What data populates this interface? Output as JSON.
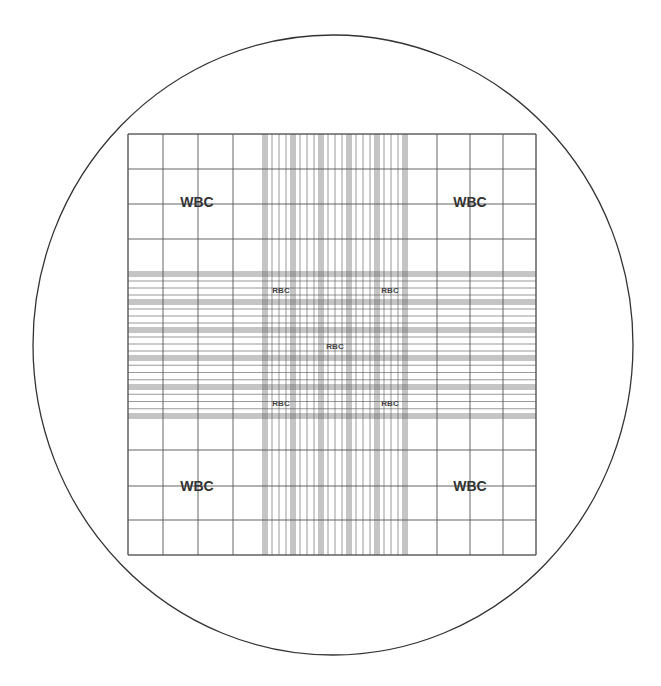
{
  "diagram": {
    "colors": {
      "background": "#ffffff",
      "circle": "#333333",
      "grid_line": "#555555",
      "label_dark": "#333333"
    },
    "circle": {
      "cx": 333,
      "cy": 345,
      "rx": 300,
      "ry": 310
    },
    "grid": {
      "x_start": 128,
      "x_end": 536,
      "y_start": 134,
      "y_end": 555,
      "outer_x_lines": [
        128,
        163,
        198,
        233,
        265,
        405,
        437,
        470,
        503,
        536
      ],
      "outer_y_lines": [
        134,
        169,
        204,
        239,
        274,
        416,
        450,
        486,
        520,
        555
      ],
      "center_x_groups": [
        265,
        293,
        321,
        349,
        377,
        405
      ],
      "center_y_groups": [
        274,
        302,
        330,
        358,
        387,
        416
      ],
      "subdivisions": 4
    },
    "labels": {
      "wbc": [
        {
          "text": "WBC",
          "x": 197,
          "y": 207
        },
        {
          "text": "WBC",
          "x": 470,
          "y": 207
        },
        {
          "text": "WBC",
          "x": 197,
          "y": 491
        },
        {
          "text": "WBC",
          "x": 470,
          "y": 491
        }
      ],
      "rbc": [
        {
          "text": "RBC",
          "x": 281,
          "y": 293
        },
        {
          "text": "RBC",
          "x": 390,
          "y": 293
        },
        {
          "text": "RBC",
          "x": 335,
          "y": 349
        },
        {
          "text": "RBC",
          "x": 281,
          "y": 406
        },
        {
          "text": "RBC",
          "x": 390,
          "y": 406
        }
      ]
    }
  }
}
